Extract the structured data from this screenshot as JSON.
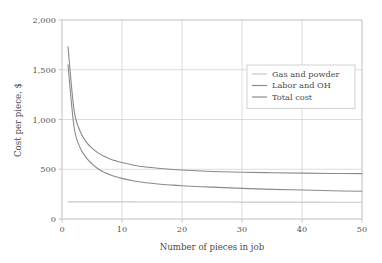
{
  "chart_data": {
    "type": "line",
    "title": "",
    "xlabel": "Number of pieces in job",
    "ylabel": "Cost per piece, $",
    "xlim": [
      0,
      50
    ],
    "ylim": [
      0,
      2000
    ],
    "xticks": [
      "0",
      "10",
      "20",
      "30",
      "40",
      "50"
    ],
    "xtick_values": [
      0,
      10,
      20,
      30,
      40,
      50
    ],
    "yticks": [
      "0",
      "500",
      "1,000",
      "1,500",
      "2,000"
    ],
    "ytick_values": [
      0,
      500,
      1000,
      1500,
      2000
    ],
    "grid": true,
    "legend_position": "upper right",
    "series": [
      {
        "name": "Gas and powder",
        "color": "#c9c9c9",
        "x": [
          1,
          2,
          3,
          4,
          5,
          6,
          7,
          8,
          9,
          10,
          12,
          14,
          16,
          18,
          20,
          25,
          30,
          35,
          40,
          45,
          50
        ],
        "values": [
          172,
          172,
          172,
          172,
          172,
          172,
          172,
          172,
          172,
          172,
          172,
          171,
          171,
          171,
          171,
          171,
          170,
          170,
          170,
          169,
          169
        ]
      },
      {
        "name": "Labor and OH",
        "color": "#8a8a8a",
        "x": [
          1,
          2,
          3,
          4,
          5,
          6,
          7,
          8,
          9,
          10,
          12,
          14,
          16,
          18,
          20,
          25,
          30,
          35,
          40,
          45,
          50
        ],
        "values": [
          1550,
          930,
          720,
          620,
          555,
          505,
          470,
          445,
          425,
          408,
          382,
          365,
          352,
          342,
          334,
          320,
          308,
          298,
          291,
          284,
          279
        ]
      },
      {
        "name": "Total cost",
        "color": "#8a8a8a",
        "x": [
          1,
          2,
          3,
          4,
          5,
          6,
          7,
          8,
          9,
          10,
          12,
          14,
          16,
          18,
          20,
          25,
          30,
          35,
          40,
          45,
          50
        ],
        "values": [
          1730,
          1100,
          885,
          778,
          712,
          665,
          630,
          604,
          584,
          567,
          541,
          523,
          510,
          500,
          492,
          478,
          470,
          465,
          461,
          458,
          456
        ]
      }
    ]
  },
  "legend": {
    "items": [
      {
        "label": "Gas and powder"
      },
      {
        "label": "Labor and OH"
      },
      {
        "label": "Total cost"
      }
    ]
  },
  "colors": {
    "grid": "#d4d4d4",
    "axis": "#bdbdbd",
    "frame": "#cccccc",
    "text": "#4a4a4a",
    "background": "#ffffff"
  }
}
